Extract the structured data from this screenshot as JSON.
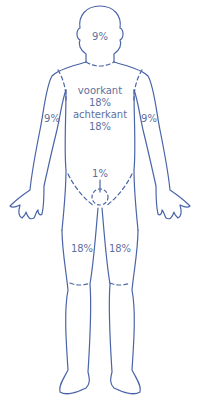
{
  "diagram": {
    "type": "body-surface-rule-of-nines",
    "colors": {
      "outline": "#4a64a8",
      "text": "#5f6f9e",
      "background": "#ffffff"
    },
    "regions": {
      "head": {
        "label": "9%"
      },
      "trunk": {
        "front_label": "voorkant",
        "front_value": "18%",
        "back_label": "achterkant",
        "back_value": "18%"
      },
      "left_arm": {
        "label": "9%"
      },
      "right_arm": {
        "label": "9%"
      },
      "genitals": {
        "label": "1%"
      },
      "left_leg": {
        "label": "18%"
      },
      "right_leg": {
        "label": "18%"
      }
    }
  }
}
